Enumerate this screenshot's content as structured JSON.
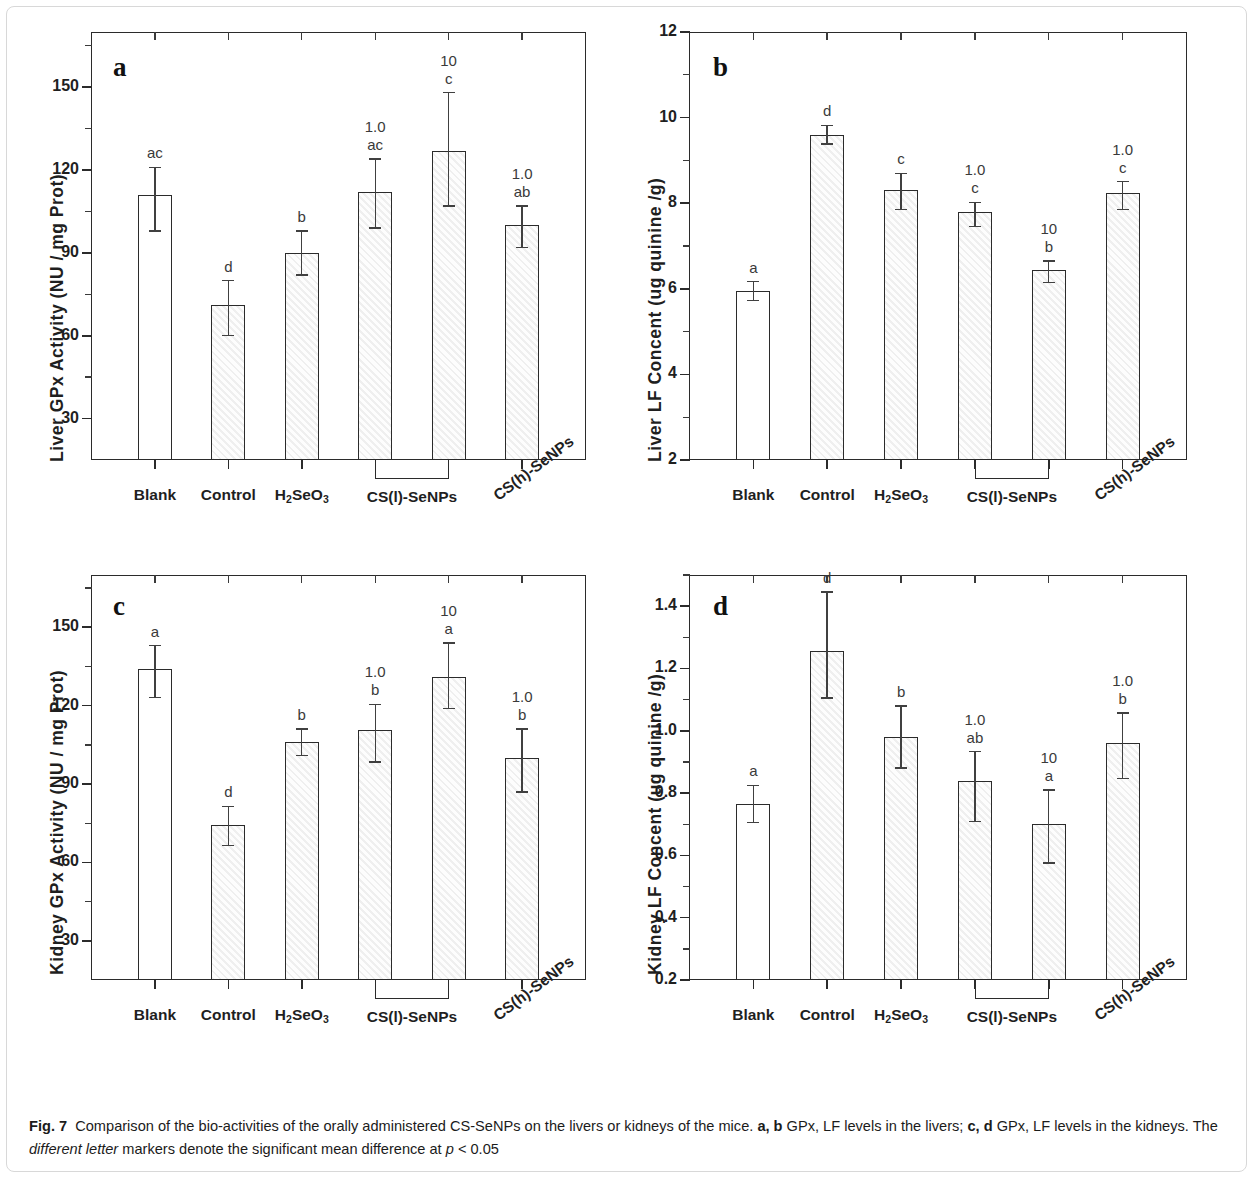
{
  "figure": {
    "label": "Fig. 7",
    "caption_line1_a": "Comparison of the bio-activities of the orally administered CS-SeNPs on the livers or kidneys of the mice. ",
    "caption_ab": "a, b",
    "caption_line1_b": " GPx, LF levels in the livers; ",
    "caption_cd": "c, d",
    "caption_line2_a": " GPx, LF levels in the kidneys. The ",
    "caption_italic": "different letter",
    "caption_line2_b": " markers denote the significant mean difference at ",
    "caption_p": "p",
    "caption_line2_c": " < 0.05"
  },
  "categories": [
    "Blank",
    "Control",
    "H2SeO3",
    "CS(l)-SeNPs",
    "CS(h)-SeNPs"
  ],
  "xlabels": {
    "blank": "Blank",
    "control": "Control",
    "h2seo3_main": "H",
    "h2seo3_sub1": "2",
    "h2seo3_mid": "SeO",
    "h2seo3_sub2": "3",
    "csl": "CS(l)-SeNPs",
    "csh": "CS(h)-SeNPs"
  },
  "chart_data": [
    {
      "panel": "a",
      "type": "bar",
      "title": "a",
      "ylabel": "Liver GPx Activity (NU / mg Prot)",
      "xlabel": "",
      "ylim": [
        15,
        170
      ],
      "yticks": [
        30,
        60,
        90,
        120,
        150
      ],
      "ytick_labels": [
        "30",
        "60",
        "90",
        "120",
        "150"
      ],
      "grid": false,
      "legend": "none",
      "categories": [
        "Blank",
        "Control",
        "H2SeO3",
        "CS(l)-SeNPs 1.0",
        "CS(l)-SeNPs 10",
        "CS(h)-SeNPs 1.0"
      ],
      "values": [
        111,
        71,
        90,
        112,
        127,
        100
      ],
      "errors_up": [
        10,
        9,
        8,
        12,
        21,
        7
      ],
      "errors_down": [
        13,
        11,
        8,
        13,
        20,
        8
      ],
      "sig_letters": [
        "ac",
        "d",
        "b",
        "ac",
        "c",
        "ab"
      ],
      "dose_labels": [
        "",
        "",
        "",
        "1.0",
        "10",
        "1.0"
      ],
      "fills": [
        "plain",
        "hatch",
        "hatch",
        "hatch",
        "hatch",
        "hatch"
      ]
    },
    {
      "panel": "b",
      "type": "bar",
      "title": "b",
      "ylabel": "Liver LF Concent (ug quinine /g)",
      "xlabel": "",
      "ylim": [
        2,
        12
      ],
      "yticks": [
        2,
        4,
        6,
        8,
        10,
        12
      ],
      "ytick_labels": [
        "2",
        "4",
        "6",
        "8",
        "10",
        "12"
      ],
      "grid": false,
      "legend": "none",
      "categories": [
        "Blank",
        "Control",
        "H2SeO3",
        "CS(l)-SeNPs 1.0",
        "CS(l)-SeNPs 10",
        "CS(h)-SeNPs 1.0"
      ],
      "values": [
        5.95,
        9.6,
        8.3,
        7.8,
        6.45,
        8.25
      ],
      "errors_up": [
        0.22,
        0.22,
        0.4,
        0.22,
        0.2,
        0.25
      ],
      "errors_down": [
        0.22,
        0.22,
        0.45,
        0.35,
        0.3,
        0.4
      ],
      "sig_letters": [
        "a",
        "d",
        "c",
        "c",
        "b",
        "c"
      ],
      "dose_labels": [
        "",
        "",
        "",
        "1.0",
        "10",
        "1.0"
      ],
      "fills": [
        "plain",
        "hatch",
        "hatch",
        "hatch",
        "hatch",
        "hatch"
      ]
    },
    {
      "panel": "c",
      "type": "bar",
      "title": "c",
      "ylabel": "Kidney GPx Activity (NU / mg Prot)",
      "xlabel": "",
      "ylim": [
        15,
        170
      ],
      "yticks": [
        30,
        60,
        90,
        120,
        150
      ],
      "ytick_labels": [
        "30",
        "60",
        "90",
        "120",
        "150"
      ],
      "grid": false,
      "legend": "none",
      "categories": [
        "Blank",
        "Control",
        "H2SeO3",
        "CS(l)-SeNPs 1.0",
        "CS(l)-SeNPs 10",
        "CS(h)-SeNPs 1.0"
      ],
      "values": [
        134,
        74.5,
        106,
        110.5,
        131,
        100
      ],
      "errors_up": [
        9,
        7,
        5,
        10,
        13,
        11
      ],
      "errors_down": [
        11,
        8,
        5,
        12,
        12,
        13
      ],
      "sig_letters": [
        "a",
        "d",
        "b",
        "b",
        "a",
        "b"
      ],
      "dose_labels": [
        "",
        "",
        "",
        "1.0",
        "10",
        "1.0"
      ],
      "fills": [
        "plain",
        "hatch",
        "hatch",
        "hatch",
        "hatch",
        "hatch"
      ]
    },
    {
      "panel": "d",
      "type": "bar",
      "title": "d",
      "ylabel": "Kidney LF Concent (ug quinine /g)",
      "xlabel": "",
      "ylim": [
        0.2,
        1.5
      ],
      "yticks": [
        0.2,
        0.4,
        0.6,
        0.8,
        1.0,
        1.2,
        1.4
      ],
      "ytick_labels": [
        "0.2",
        "0.4",
        "0.6",
        "0.8",
        "1.0",
        "1.2",
        "1.4"
      ],
      "grid": false,
      "legend": "none",
      "categories": [
        "Blank",
        "Control",
        "H2SeO3",
        "CS(l)-SeNPs 1.0",
        "CS(l)-SeNPs 10",
        "CS(h)-SeNPs 1.0"
      ],
      "values": [
        0.765,
        1.255,
        0.98,
        0.838,
        0.7,
        0.962
      ],
      "errors_up": [
        0.06,
        0.19,
        0.1,
        0.095,
        0.11,
        0.095
      ],
      "errors_down": [
        0.06,
        0.15,
        0.1,
        0.13,
        0.125,
        0.115
      ],
      "sig_letters": [
        "a",
        "d",
        "b",
        "ab",
        "a",
        "b"
      ],
      "dose_labels": [
        "",
        "",
        "",
        "1.0",
        "10",
        "1.0"
      ],
      "fills": [
        "plain",
        "hatch",
        "hatch",
        "hatch",
        "hatch",
        "hatch"
      ]
    }
  ]
}
